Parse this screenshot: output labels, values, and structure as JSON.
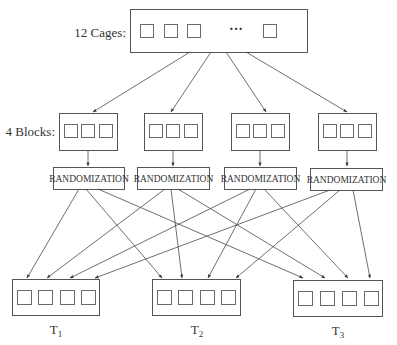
{
  "diagram": {
    "type": "flowchart",
    "title": "",
    "top": {
      "label": "12 Cages:",
      "ellipsis": "···",
      "visible_squares": 4
    },
    "blocks": {
      "label": "4 Blocks:",
      "count": 4,
      "squares_per_block": 3
    },
    "randomization": {
      "labels": [
        "RANDOMIZATION",
        "RANDOMIZATION",
        "RANDOMIZATION",
        "RANDOMIZATION"
      ]
    },
    "treatments": {
      "labels": [
        {
          "main": "T",
          "sub": "1"
        },
        {
          "main": "T",
          "sub": "2"
        },
        {
          "main": "T",
          "sub": "3"
        }
      ],
      "squares_per_treatment": 4
    },
    "edges": {
      "cages_to_blocks": 4,
      "blocks_to_randomization": 4,
      "randomization_to_treatments": 12
    }
  }
}
